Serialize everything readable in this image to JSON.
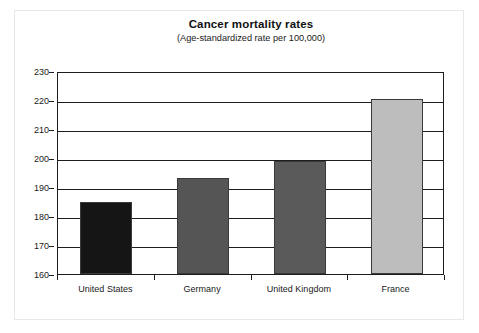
{
  "chart_data": {
    "type": "bar",
    "title": "Cancer mortality rates",
    "subtitle": "(Age-standardized rate per 100,000)",
    "xlabel": "",
    "ylabel": "",
    "categories": [
      "United States",
      "Germany",
      "United Kingdom",
      "France"
    ],
    "values": [
      185,
      193,
      199,
      220.5
    ],
    "ylim": [
      160,
      230
    ],
    "yticks": [
      160,
      170,
      180,
      190,
      200,
      210,
      220,
      230
    ],
    "ytick_labels": [
      "160",
      "170",
      "180",
      "190",
      "200",
      "210",
      "220",
      "230"
    ],
    "grid": true,
    "grid_axis": "y",
    "legend": false,
    "bar_colors": [
      "#151515",
      "#555555",
      "#5a5a5a",
      "#bdbdbd"
    ],
    "series": [
      {
        "name": "Cancer mortality rate",
        "values": [
          185,
          193,
          199,
          220.5
        ]
      }
    ]
  },
  "style": {
    "axis_color": "#1d1d1d",
    "text_color": "#1a1a1a",
    "background": "#ffffff",
    "page_border": "#e8e8e8"
  }
}
